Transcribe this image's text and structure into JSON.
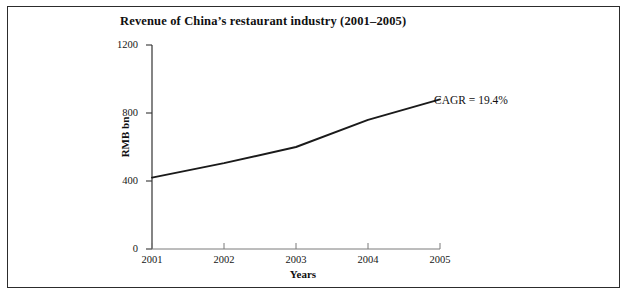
{
  "figure": {
    "border_color": "#2c2c2c",
    "background": "#ffffff"
  },
  "chart_data": {
    "type": "line",
    "title": "Revenue of China’s restaurant industry (2001–2005)",
    "xlabel": "Years",
    "ylabel": "RMB bn",
    "categories": [
      "2001",
      "2002",
      "2003",
      "2004",
      "2005"
    ],
    "x": [
      2001,
      2002,
      2003,
      2004,
      2005
    ],
    "values": [
      420,
      505,
      600,
      760,
      880
    ],
    "series": [
      {
        "name": "Revenue",
        "values": [
          420,
          505,
          600,
          760,
          880
        ],
        "color": "#1a1a1a"
      }
    ],
    "ylim": [
      0,
      1200
    ],
    "yticks": [
      0,
      400,
      800,
      1200
    ],
    "ytick_labels": [
      "0",
      "400",
      "800",
      "1200"
    ],
    "xlim": [
      2001,
      2005
    ],
    "xticks": [
      2001,
      2002,
      2003,
      2004,
      2005
    ],
    "xtick_labels": [
      "2001",
      "2002",
      "2003",
      "2004",
      "2005"
    ],
    "grid": false,
    "legend": "none",
    "line_color": "#1a1a1a",
    "annotations": [
      {
        "text": "CAGR = 19.4%",
        "anchor_x": 2005,
        "anchor_y": 880
      }
    ]
  }
}
